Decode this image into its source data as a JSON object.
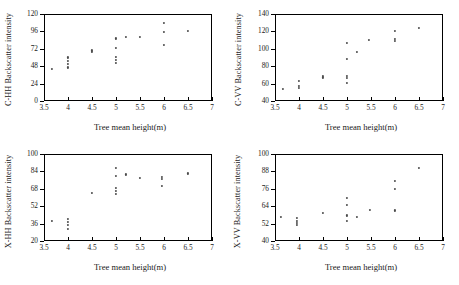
{
  "figure": {
    "panel_count": 4,
    "marker_color": "#4a4a4a",
    "axis_color": "#000000",
    "background": "#ffffff"
  },
  "chart_data": [
    {
      "id": "c-hh",
      "type": "scatter",
      "title": "",
      "xlabel": "Tree mean height(m)",
      "ylabel": "C-HH Backscatter intensity",
      "xlim": [
        3.5,
        7
      ],
      "ylim": [
        0,
        120
      ],
      "xticks": [
        3.5,
        4,
        4.5,
        5,
        5.5,
        6,
        6.5,
        7
      ],
      "xticklabels": [
        "3.5",
        "4",
        "4.5",
        "5",
        "5.5",
        "6",
        "6.5",
        "7"
      ],
      "yticks": [
        0,
        24,
        48,
        72,
        96,
        120
      ],
      "yticklabels": [
        "0",
        "24",
        "48",
        "72",
        "96",
        "120"
      ],
      "grid": false,
      "legend": null,
      "points": [
        {
          "x": 3.66,
          "y": 44.5
        },
        {
          "x": 4.0,
          "y": 60.0
        },
        {
          "x": 4.0,
          "y": 55.0
        },
        {
          "x": 4.0,
          "y": 51.0
        },
        {
          "x": 4.0,
          "y": 46.0
        },
        {
          "x": 4.5,
          "y": 69.5
        },
        {
          "x": 4.5,
          "y": 67.0
        },
        {
          "x": 5.0,
          "y": 86.0
        },
        {
          "x": 5.0,
          "y": 73.0
        },
        {
          "x": 5.0,
          "y": 61.0
        },
        {
          "x": 5.0,
          "y": 56.0
        },
        {
          "x": 5.0,
          "y": 52.0
        },
        {
          "x": 5.2,
          "y": 88.0
        },
        {
          "x": 5.5,
          "y": 88.0
        },
        {
          "x": 6.0,
          "y": 108.0
        },
        {
          "x": 6.0,
          "y": 95.0
        },
        {
          "x": 6.0,
          "y": 77.5
        },
        {
          "x": 6.5,
          "y": 97.0
        }
      ]
    },
    {
      "id": "c-vv",
      "type": "scatter",
      "title": "",
      "xlabel": "Tree mean height(m)",
      "ylabel": "C-VV Backscatter intensity",
      "xlim": [
        3.5,
        7
      ],
      "ylim": [
        40,
        140
      ],
      "xticks": [
        3.5,
        4,
        4.5,
        5,
        5.5,
        6,
        6.5,
        7
      ],
      "xticklabels": [
        "3.5",
        "4",
        "4.5",
        "5",
        "5.5",
        "6",
        "6.5",
        "7"
      ],
      "yticks": [
        40,
        60,
        80,
        100,
        120,
        140
      ],
      "yticklabels": [
        "40",
        "60",
        "80",
        "100",
        "120",
        "140"
      ],
      "grid": false,
      "legend": null,
      "points": [
        {
          "x": 3.66,
          "y": 54.0
        },
        {
          "x": 4.0,
          "y": 62.5
        },
        {
          "x": 4.0,
          "y": 57.0
        },
        {
          "x": 4.0,
          "y": 55.0
        },
        {
          "x": 4.5,
          "y": 69.0
        },
        {
          "x": 4.5,
          "y": 67.0
        },
        {
          "x": 5.0,
          "y": 107.0
        },
        {
          "x": 5.0,
          "y": 88.0
        },
        {
          "x": 5.0,
          "y": 69.0
        },
        {
          "x": 5.0,
          "y": 66.0
        },
        {
          "x": 5.0,
          "y": 61.0
        },
        {
          "x": 5.2,
          "y": 96.5
        },
        {
          "x": 5.45,
          "y": 110.0
        },
        {
          "x": 6.0,
          "y": 120.5
        },
        {
          "x": 6.0,
          "y": 111.0
        },
        {
          "x": 6.0,
          "y": 108.5
        },
        {
          "x": 6.5,
          "y": 123.5
        }
      ]
    },
    {
      "id": "x-hh",
      "type": "scatter",
      "title": "",
      "xlabel": "Tree mean height(m)",
      "ylabel": "X-HH Backscatter intensity",
      "xlim": [
        3.5,
        7
      ],
      "ylim": [
        20,
        100
      ],
      "xticks": [
        3.5,
        4,
        4.5,
        5,
        5.5,
        6,
        6.5,
        7
      ],
      "xticklabels": [
        "3.5",
        "4",
        "4.5",
        "5",
        "5.5",
        "6",
        "6.5",
        "7"
      ],
      "yticks": [
        20,
        36,
        52,
        68,
        84,
        100
      ],
      "yticklabels": [
        "20",
        "36",
        "52",
        "68",
        "84",
        "100"
      ],
      "grid": false,
      "legend": null,
      "points": [
        {
          "x": 3.66,
          "y": 38.5
        },
        {
          "x": 4.0,
          "y": 40.0
        },
        {
          "x": 4.0,
          "y": 37.5
        },
        {
          "x": 4.0,
          "y": 34.5
        },
        {
          "x": 4.0,
          "y": 31.0
        },
        {
          "x": 4.5,
          "y": 64.0
        },
        {
          "x": 5.0,
          "y": 87.0
        },
        {
          "x": 5.0,
          "y": 80.0
        },
        {
          "x": 5.0,
          "y": 69.0
        },
        {
          "x": 5.0,
          "y": 66.0
        },
        {
          "x": 5.0,
          "y": 63.5
        },
        {
          "x": 5.2,
          "y": 81.0
        },
        {
          "x": 5.5,
          "y": 77.5
        },
        {
          "x": 5.95,
          "y": 79.0
        },
        {
          "x": 5.95,
          "y": 77.0
        },
        {
          "x": 5.95,
          "y": 70.5
        },
        {
          "x": 6.5,
          "y": 82.0
        }
      ]
    },
    {
      "id": "x-vv",
      "type": "scatter",
      "title": "",
      "xlabel": "Tree mean height(m)",
      "ylabel": "X-VV Backscatter intensity",
      "xlim": [
        3.5,
        7
      ],
      "ylim": [
        40,
        100
      ],
      "xticks": [
        3.5,
        4,
        4.5,
        5,
        5.5,
        6,
        6.5,
        7
      ],
      "xticklabels": [
        "3.5",
        "4",
        "4.5",
        "5",
        "5.5",
        "6",
        "6.5",
        "7"
      ],
      "yticks": [
        40,
        52,
        64,
        76,
        88,
        100
      ],
      "yticklabels": [
        "40",
        "52",
        "64",
        "76",
        "88",
        "100"
      ],
      "grid": false,
      "legend": null,
      "points": [
        {
          "x": 3.62,
          "y": 56.5
        },
        {
          "x": 3.95,
          "y": 56.0
        },
        {
          "x": 3.95,
          "y": 54.0
        },
        {
          "x": 3.95,
          "y": 52.5
        },
        {
          "x": 3.95,
          "y": 51.0
        },
        {
          "x": 4.5,
          "y": 59.5
        },
        {
          "x": 5.0,
          "y": 69.5
        },
        {
          "x": 5.0,
          "y": 64.5
        },
        {
          "x": 5.0,
          "y": 57.5
        },
        {
          "x": 5.0,
          "y": 54.0
        },
        {
          "x": 5.2,
          "y": 56.5
        },
        {
          "x": 5.48,
          "y": 61.5
        },
        {
          "x": 6.0,
          "y": 81.5
        },
        {
          "x": 6.0,
          "y": 76.0
        },
        {
          "x": 6.0,
          "y": 61.0
        },
        {
          "x": 6.5,
          "y": 90.5
        }
      ]
    }
  ]
}
